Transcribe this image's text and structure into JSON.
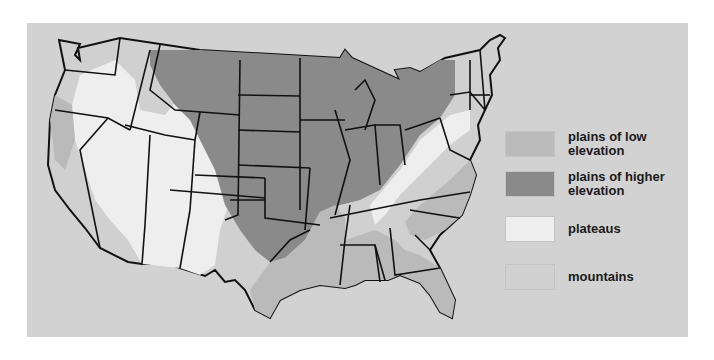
{
  "map": {
    "title": "",
    "subject": "Landforms of the contiguous United States",
    "colors": {
      "background": "#d2d2d2",
      "low_plains": "#bababa",
      "high_plains": "#8a8a8a",
      "plateaus": "#eeeeee",
      "mountains": "#d0d0d0",
      "borders": "#111111"
    }
  },
  "legend": {
    "items": [
      {
        "label": "plains of low\nelevation",
        "color": "#bababa"
      },
      {
        "label": "plains of higher\nelevation",
        "color": "#8a8a8a"
      },
      {
        "label": "plateaus",
        "color": "#eeeeee"
      },
      {
        "label": "mountains",
        "color": "#d0d0d0"
      }
    ]
  }
}
